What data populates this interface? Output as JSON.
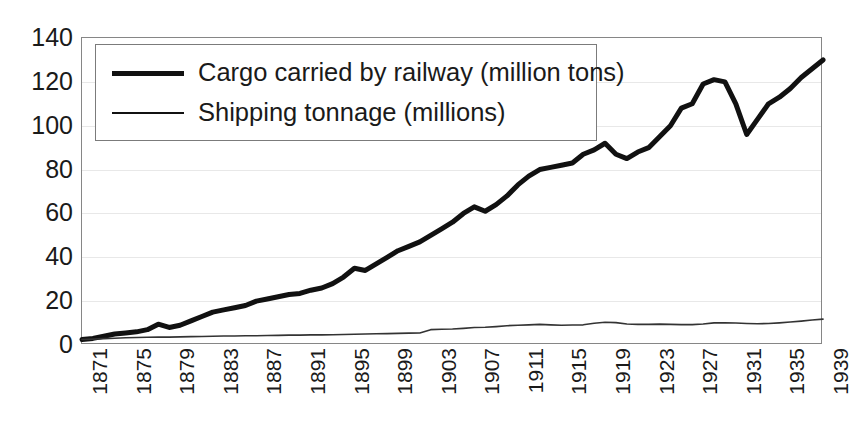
{
  "chart_data": {
    "type": "line",
    "title": "",
    "subtitle": "",
    "xlabel": "",
    "ylabel": "",
    "xlim": [
      1871,
      1939
    ],
    "ylim": [
      0,
      140
    ],
    "ytick_step": 20,
    "yticks": [
      140,
      120,
      100,
      80,
      60,
      40,
      20,
      0
    ],
    "xticks": [
      1871,
      1875,
      1879,
      1883,
      1887,
      1891,
      1895,
      1899,
      1903,
      1907,
      1911,
      1915,
      1919,
      1923,
      1927,
      1931,
      1935,
      1939
    ],
    "xtick_step": 4,
    "xtick_rotation": -90,
    "grid": "horizontal",
    "grid_color": "#e8e8e8",
    "legend_position": "top-left-inside",
    "x": [
      1871,
      1872,
      1873,
      1874,
      1875,
      1876,
      1877,
      1878,
      1879,
      1880,
      1881,
      1882,
      1883,
      1884,
      1885,
      1886,
      1887,
      1888,
      1889,
      1890,
      1891,
      1892,
      1893,
      1894,
      1895,
      1896,
      1897,
      1898,
      1899,
      1900,
      1901,
      1902,
      1903,
      1904,
      1905,
      1906,
      1907,
      1908,
      1909,
      1910,
      1911,
      1912,
      1913,
      1914,
      1915,
      1916,
      1917,
      1918,
      1919,
      1920,
      1921,
      1922,
      1923,
      1924,
      1925,
      1926,
      1927,
      1928,
      1929,
      1930,
      1931,
      1932,
      1933,
      1934,
      1935,
      1936,
      1937,
      1938,
      1939
    ],
    "series": [
      {
        "name": "Cargo carried by railway (million tons)",
        "unit": "million tons",
        "color": "#111111",
        "width": 5,
        "values": [
          2.5,
          3,
          4,
          5,
          5.5,
          6,
          7,
          9.5,
          8,
          9,
          11,
          13,
          15,
          16,
          17,
          18,
          20,
          21,
          22,
          23,
          23.5,
          25,
          26,
          28,
          31,
          35,
          34,
          37,
          40,
          43,
          45,
          47,
          50,
          53,
          56,
          60,
          63,
          61,
          64,
          68,
          73,
          77,
          80,
          81,
          82,
          83,
          87,
          89,
          92,
          87,
          85,
          88,
          90,
          95,
          100,
          108,
          110,
          119,
          121,
          120,
          110,
          96,
          103,
          110,
          113,
          117,
          122,
          126,
          130
        ]
      },
      {
        "name": "Shipping tonnage (millions)",
        "unit": "millions",
        "color": "#333333",
        "width": 1.6,
        "values": [
          2.5,
          2.7,
          2.9,
          3.1,
          3.3,
          3.4,
          3.5,
          3.6,
          3.6,
          3.7,
          3.8,
          3.9,
          4,
          4.1,
          4.1,
          4.2,
          4.2,
          4.3,
          4.4,
          4.5,
          4.5,
          4.6,
          4.6,
          4.7,
          4.8,
          4.9,
          5,
          5.1,
          5.2,
          5.3,
          5.4,
          5.5,
          7,
          7.2,
          7.3,
          7.6,
          8,
          8.1,
          8.4,
          8.8,
          9,
          9.2,
          9.4,
          9.2,
          9,
          9.1,
          9.2,
          9.9,
          10.4,
          10.2,
          9.6,
          9.4,
          9.4,
          9.5,
          9.4,
          9.3,
          9.3,
          9.6,
          10.1,
          10.1,
          10,
          9.8,
          9.7,
          9.8,
          10.1,
          10.5,
          10.9,
          11.4,
          11.8
        ]
      }
    ]
  },
  "legend": {
    "entries": [
      {
        "label": "Cargo carried by railway (million tons)",
        "style": "thick"
      },
      {
        "label": "Shipping tonnage (millions)",
        "style": "thin"
      }
    ]
  }
}
